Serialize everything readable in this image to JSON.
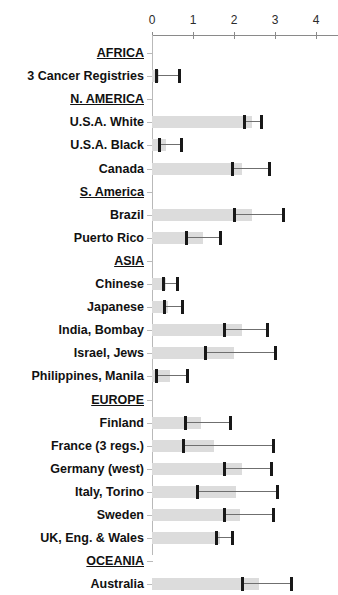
{
  "chart_data": {
    "type": "bar",
    "title": "",
    "xlabel": "",
    "ylabel": "",
    "xlim": [
      0,
      4.55
    ],
    "grid": false,
    "legend": null,
    "orientation": "horizontal",
    "axis": {
      "ticks": [
        0,
        1,
        2,
        3,
        4
      ],
      "tick_labels": [
        "0",
        "1",
        "2",
        "3",
        "4"
      ]
    },
    "note": "Horizontal bar chart with point estimate tick marks and upper confidence-limit whiskers, grouped by world region.",
    "rows": [
      {
        "label": "AFRICA",
        "type": "heading"
      },
      {
        "label": "3 Cancer Registries",
        "type": "data",
        "bar": 0.18,
        "point": 0.1,
        "upper": 0.65
      },
      {
        "label": "N. AMERICA",
        "type": "heading"
      },
      {
        "label": "U.S.A. White",
        "type": "data",
        "bar": 2.45,
        "point": 2.25,
        "upper": 2.65
      },
      {
        "label": "U.S.A. Black",
        "type": "data",
        "bar": 0.35,
        "point": 0.17,
        "upper": 0.7
      },
      {
        "label": "Canada",
        "type": "data",
        "bar": 2.2,
        "point": 1.95,
        "upper": 2.85
      },
      {
        "label": "S. America",
        "type": "heading"
      },
      {
        "label": "Brazil",
        "type": "data",
        "bar": 2.45,
        "point": 2.0,
        "upper": 3.2
      },
      {
        "label": "Puerto Rico",
        "type": "data",
        "bar": 1.25,
        "point": 0.83,
        "upper": 1.65
      },
      {
        "label": "ASIA",
        "type": "heading"
      },
      {
        "label": "Chinese",
        "type": "data",
        "bar": 0.35,
        "point": 0.28,
        "upper": 0.6
      },
      {
        "label": "Japanese",
        "type": "data",
        "bar": 0.38,
        "point": 0.3,
        "upper": 0.72
      },
      {
        "label": "India, Bombay",
        "type": "data",
        "bar": 2.2,
        "point": 1.75,
        "upper": 2.8
      },
      {
        "label": "Israel, Jews",
        "type": "data",
        "bar": 2.0,
        "point": 1.3,
        "upper": 3.0
      },
      {
        "label": "Philippines, Manila",
        "type": "data",
        "bar": 0.45,
        "point": 0.1,
        "upper": 0.85
      },
      {
        "label": "EUROPE",
        "type": "heading"
      },
      {
        "label": "Finland",
        "type": "data",
        "bar": 1.2,
        "point": 0.8,
        "upper": 1.9
      },
      {
        "label": "France (3 regs.)",
        "type": "data",
        "bar": 1.5,
        "point": 0.75,
        "upper": 2.95
      },
      {
        "label": "Germany (west)",
        "type": "data",
        "bar": 2.2,
        "point": 1.75,
        "upper": 2.9
      },
      {
        "label": "Italy, Torino",
        "type": "data",
        "bar": 2.05,
        "point": 1.1,
        "upper": 3.05
      },
      {
        "label": "Sweden",
        "type": "data",
        "bar": 2.15,
        "point": 1.75,
        "upper": 2.95
      },
      {
        "label": "UK, Eng. & Wales",
        "type": "data",
        "bar": 1.65,
        "point": 1.55,
        "upper": 1.95
      },
      {
        "label": "OCEANIA",
        "type": "heading"
      },
      {
        "label": "Australia",
        "type": "data",
        "bar": 2.6,
        "point": 2.2,
        "upper": 3.4
      }
    ]
  }
}
